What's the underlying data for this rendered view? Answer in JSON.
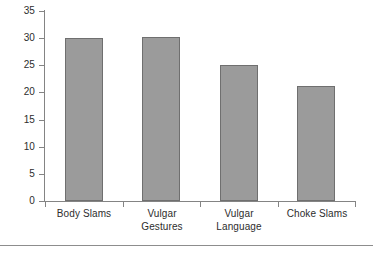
{
  "chart_data": {
    "type": "bar",
    "title": "",
    "subtitle": "",
    "xlabel": "",
    "ylabel": "",
    "categories": [
      "Body Slams",
      "Vulgar Gestures",
      "Vulgar Language",
      "Choke Slams"
    ],
    "category_lines": [
      [
        "Body Slams"
      ],
      [
        "Vulgar",
        "Gestures"
      ],
      [
        "Vulgar",
        "Language"
      ],
      [
        "Choke Slams"
      ]
    ],
    "values": [
      30.0,
      30.2,
      25.1,
      21.2
    ],
    "ylim": [
      0,
      35
    ],
    "ytick_labels": [
      "0",
      "5",
      "10",
      "15",
      "20",
      "25",
      "30",
      "35"
    ],
    "ytick_values": [
      0,
      5,
      10,
      15,
      20,
      25,
      30,
      35
    ],
    "grid": false,
    "legend": false,
    "legend_position": "none",
    "bar_fill_color": "#9b9b9b",
    "bar_border_color": "#6f6f6f",
    "axis_color": "#848484",
    "text_color": "#2d2d2d",
    "background_color": "#ffffff"
  },
  "figure": {
    "bottom_rule": true
  }
}
